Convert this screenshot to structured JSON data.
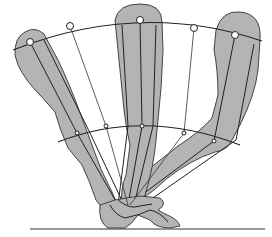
{
  "diagram": {
    "type": "kinematic stride diagram",
    "colors": {
      "leg_fill": "#b4b4b4",
      "line": "#222222",
      "background": "#ffffff"
    },
    "upper_arc_nodes": [
      {
        "x": 30,
        "y": 42
      },
      {
        "x": 70,
        "y": 26
      },
      {
        "x": 140,
        "y": 20
      },
      {
        "x": 194,
        "y": 28
      },
      {
        "x": 235,
        "y": 35
      }
    ],
    "lower_arc_nodes": [
      {
        "x": 77,
        "y": 133
      },
      {
        "x": 106,
        "y": 126
      },
      {
        "x": 142,
        "y": 126
      },
      {
        "x": 184,
        "y": 133
      },
      {
        "x": 214,
        "y": 141
      }
    ],
    "ground_y": 229,
    "legs": [
      "leg-left",
      "leg-center",
      "leg-right"
    ]
  }
}
